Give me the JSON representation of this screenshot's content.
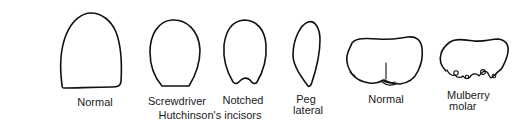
{
  "figure": {
    "stroke_color": "#111111",
    "background": "#ffffff",
    "items": [
      {
        "id": "normal-incisor",
        "label": "Normal"
      },
      {
        "id": "screwdriver-incisor",
        "label": "Screwdriver"
      },
      {
        "id": "notched-incisor",
        "label": "Notched"
      },
      {
        "id": "peg-lateral",
        "label_line1": "Peg",
        "label_line2": "lateral"
      },
      {
        "id": "normal-molar",
        "label": "Normal"
      },
      {
        "id": "mulberry-molar",
        "label_line1": "Mulberry",
        "label_line2": "molar"
      }
    ],
    "group_label": "Hutchinson's incisors"
  }
}
